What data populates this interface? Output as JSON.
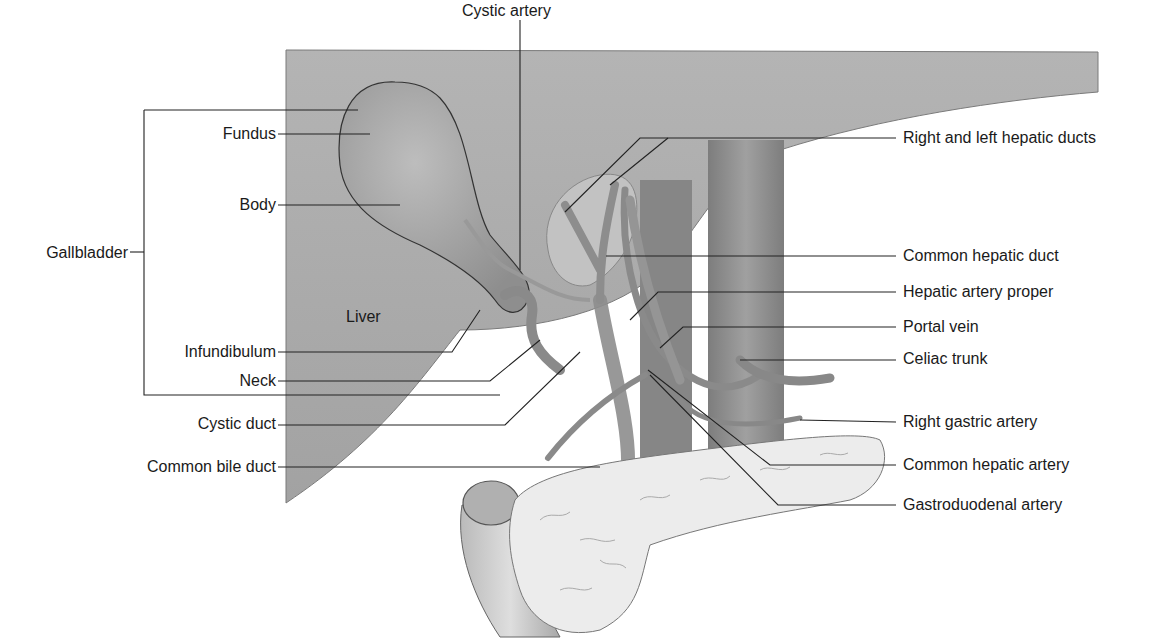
{
  "diagram": {
    "colors": {
      "liver": "#a9a9a9",
      "gallbladder": "#9d9d9d",
      "vessel": "#8c8c8c",
      "aorta": "#8a8a8a",
      "pancreas": "#ececec",
      "duodenum": "#c8c8c8",
      "leader_line": "#222222",
      "background": "#ffffff"
    },
    "labels": {
      "top": {
        "cystic_artery": "Cystic artery"
      },
      "left": {
        "fundus": "Fundus",
        "body": "Body",
        "gallbladder": "Gallbladder",
        "infundibulum": "Infundibulum",
        "neck": "Neck",
        "cystic_duct": "Cystic duct",
        "common_bile_duct": "Common bile duct"
      },
      "inner": {
        "liver": "Liver"
      },
      "right": {
        "hepatic_ducts": "Right and left hepatic ducts",
        "common_hepatic_duct": "Common hepatic duct",
        "hepatic_artery_proper": "Hepatic artery proper",
        "portal_vein": "Portal vein",
        "celiac_trunk": "Celiac trunk",
        "right_gastric_artery": "Right gastric artery",
        "common_hepatic_artery": "Common hepatic artery",
        "gastroduodenal_artery": "Gastroduodenal artery"
      }
    }
  }
}
